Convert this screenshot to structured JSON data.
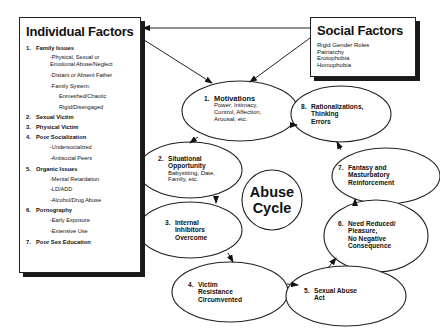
{
  "individual_factors": {
    "title": "Individual Factors",
    "items": [
      {
        "num": "1.",
        "label": "Family Issues",
        "subs": [
          "-Physical, Sexual or",
          "Emotional Abuse/Neglect",
          "-Distant or Absent Father",
          "-Family System:",
          "Enmeshed/Chaotic",
          "Rigid/Disengaged"
        ]
      },
      {
        "num": "2.",
        "label": "Sexual Victim",
        "subs": []
      },
      {
        "num": "3.",
        "label": "Physical Victim",
        "subs": []
      },
      {
        "num": "4.",
        "label": "Poor Socialization",
        "subs": [
          "-Undersocialized",
          "-Antisocial Peers"
        ]
      },
      {
        "num": "5.",
        "label": "Organic Issues",
        "subs": [
          "-Mental Retardation",
          "-LD/ADD",
          "-Alcohol/Drug Abuse"
        ]
      },
      {
        "num": "6.",
        "label": "Pornography",
        "subs": [
          "-Early Exposure",
          "-Extensive Use"
        ]
      },
      {
        "num": "7.",
        "label": "Poor Sex Education",
        "subs": []
      }
    ]
  },
  "social_factors": {
    "title": "Social Factors",
    "items": [
      "Rigid Gender Roles",
      "Patriarchy",
      "Erotophobia",
      "Homophobia"
    ]
  },
  "cycle": {
    "center": {
      "line1": "Abuse",
      "line2": "Cycle"
    },
    "nodes": [
      {
        "num": "1.",
        "title": "Motivations",
        "detail": [
          "Power, Intimacy,",
          "Control, Affection,",
          "Arousal, etc."
        ]
      },
      {
        "num": "2.",
        "title_lines": [
          "Situational",
          "Opportunity"
        ],
        "detail": [
          "Babysitting, Date,",
          "Family, etc."
        ]
      },
      {
        "num": "3.",
        "title_lines": [
          "Internal",
          "Inhibitors",
          "Overcome"
        ]
      },
      {
        "num": "4.",
        "title_lines": [
          "Victim",
          "Resistance",
          "Circumvented"
        ]
      },
      {
        "num": "5.",
        "title_lines": [
          "Sexual Abuse",
          "Act"
        ]
      },
      {
        "num": "6.",
        "title_lines": [
          "Need Reduced/",
          "Pleasure,",
          "No Negative",
          "Consequence"
        ]
      },
      {
        "num": "7.",
        "title_lines": [
          "Fantasy and",
          "Masturbatory",
          "Reinforcement"
        ]
      },
      {
        "num": "8.",
        "title_lines": [
          "Rationalizations,",
          "Thinking",
          "Errors"
        ]
      }
    ]
  },
  "colors": {
    "ink": "#111111",
    "background": "#ffffff"
  }
}
